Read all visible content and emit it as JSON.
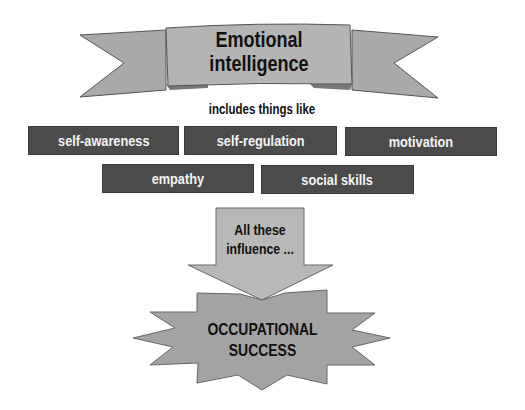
{
  "banner": {
    "title_line1": "Emotional",
    "title_line2": "intelligence"
  },
  "subtitle": "includes things like",
  "components": [
    {
      "label": "self-awareness"
    },
    {
      "label": "self-regulation"
    },
    {
      "label": "motivation"
    },
    {
      "label": "empathy"
    },
    {
      "label": "social skills"
    }
  ],
  "arrow": {
    "line1": "All these",
    "line2": "influence ..."
  },
  "outcome": {
    "line1": "OCCUPATIONAL",
    "line2": "SUCCESS"
  },
  "colors": {
    "shape_fill": "#a9a9a9",
    "banner_center_fill": "#b4b4b4",
    "box_fill": "#4b4b4b",
    "box_text": "#f4f4f4",
    "text": "#111111"
  }
}
